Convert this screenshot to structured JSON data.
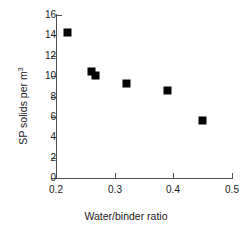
{
  "chart_data": {
    "type": "scatter",
    "title": "",
    "xlabel": "Water/binder ratio",
    "ylabel": "SP solids per m",
    "ylabel_superscript": "3",
    "ylabel_full": "SP solids per m³",
    "xlim": [
      0.2,
      0.5
    ],
    "ylim": [
      0,
      16
    ],
    "xticks": [
      0.2,
      0.3,
      0.4,
      0.5
    ],
    "xtick_labels": [
      "0.2",
      "0.3",
      "0.4",
      "0.5"
    ],
    "yticks": [
      0,
      2,
      4,
      6,
      8,
      10,
      12,
      14,
      16
    ],
    "ytick_labels": [
      "0",
      "2",
      "4",
      "6",
      "8",
      "10",
      "12",
      "14",
      "16"
    ],
    "grid": false,
    "legend": false,
    "marker": "filled-square",
    "marker_color": "#000000",
    "axis_color": "#4d4d4d",
    "points": [
      {
        "x": 0.22,
        "y": 14.3
      },
      {
        "x": 0.26,
        "y": 10.5
      },
      {
        "x": 0.268,
        "y": 10.1
      },
      {
        "x": 0.32,
        "y": 9.3
      },
      {
        "x": 0.39,
        "y": 8.6
      },
      {
        "x": 0.45,
        "y": 5.6
      }
    ]
  }
}
